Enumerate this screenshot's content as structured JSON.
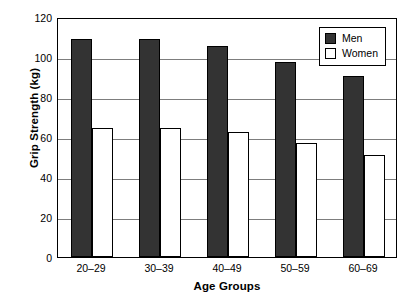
{
  "chart_data": {
    "type": "bar",
    "title": "",
    "xlabel": "Age Groups",
    "ylabel": "Grip Strength (kg)",
    "categories": [
      "20–29",
      "30–39",
      "40–49",
      "50–59",
      "60–69"
    ],
    "series": [
      {
        "name": "Men",
        "color": "#333333",
        "values": [
          109,
          109,
          105.5,
          97.5,
          90.5
        ]
      },
      {
        "name": "Women",
        "color": "#ffffff",
        "values": [
          64.5,
          64.5,
          62.5,
          57,
          51
        ]
      }
    ],
    "ylim": [
      0,
      120
    ],
    "ytick_values": [
      0,
      20,
      40,
      60,
      80,
      100,
      120
    ],
    "ytick_labels": [
      "0",
      "20",
      "40",
      "60",
      "80",
      "100",
      "120"
    ],
    "grid": "horizontal",
    "grid_color": "#7d7d7d",
    "legend_position": "top-right-inside",
    "frame_color": "#000000",
    "background": "#ffffff"
  },
  "axes": {
    "y_title": "Grip Strength (kg)",
    "x_title": "Age Groups"
  },
  "legend": {
    "entries": [
      {
        "label": "Men"
      },
      {
        "label": "Women"
      }
    ]
  }
}
